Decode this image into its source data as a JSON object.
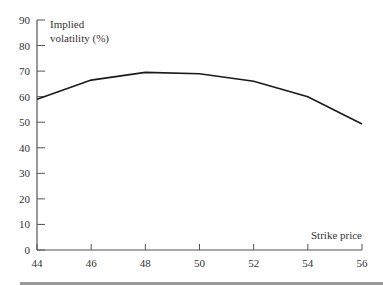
{
  "chart_data": {
    "type": "line",
    "title": "",
    "xlabel": "Strike price",
    "ylabel": "Implied volatility (%)",
    "ylabel_lines": [
      "Implied",
      "volatility (%)"
    ],
    "x": [
      44,
      46,
      48,
      50,
      52,
      54,
      56
    ],
    "series": [
      {
        "name": "Implied volatility",
        "values": [
          59,
          66.5,
          69.5,
          69,
          66,
          60,
          49.3
        ]
      }
    ],
    "xlim": [
      44,
      56
    ],
    "ylim": [
      0,
      90
    ],
    "xticks": [
      44,
      46,
      48,
      50,
      52,
      54,
      56
    ],
    "yticks": [
      0,
      10,
      20,
      30,
      40,
      50,
      60,
      70,
      80,
      90
    ],
    "grid": false,
    "legend": "none",
    "line_color": "#1a1a1a",
    "axis_color": "#555555",
    "bottom_rule_color": "#9a9a9a"
  }
}
